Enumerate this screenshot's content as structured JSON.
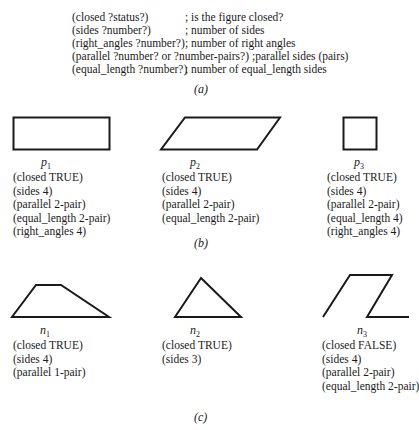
{
  "schema": {
    "lines": [
      {
        "pattern": "(closed ?status?)",
        "comment": "; is the figure closed?"
      },
      {
        "pattern": "(sides ?number?)",
        "comment": "; number of sides"
      },
      {
        "pattern": "(right_angles ?number?)",
        "comment": "; number of right angles"
      },
      {
        "pattern": "(parallel ?number? or ?number-pairs?)",
        "comment": ";parallel sides (pairs)"
      },
      {
        "pattern": "(equal_length ?number?)",
        "comment": "; number of equal_length sides"
      }
    ],
    "caption": "(a)"
  },
  "positive_examples": {
    "caption": "(b)",
    "figures": [
      {
        "label": "p",
        "index": "1",
        "shape": "rectangle",
        "props": [
          "(closed TRUE)",
          "(sides 4)",
          "(parallel 2-pair)",
          "(equal_length 2-pair)",
          "(right_angles 4)"
        ]
      },
      {
        "label": "p",
        "index": "2",
        "shape": "parallelogram",
        "props": [
          "(closed TRUE)",
          "(sides 4)",
          "(parallel 2-pair)",
          "(equal_length 2-pair)"
        ]
      },
      {
        "label": "p",
        "index": "3",
        "shape": "square",
        "props": [
          "(closed TRUE)",
          "(sides 4)",
          "(parallel 2-pair)",
          "(equal_length 4)",
          "(right_angles 4)"
        ]
      }
    ]
  },
  "negative_examples": {
    "caption": "(c)",
    "figures": [
      {
        "label": "n",
        "index": "1",
        "shape": "trapezoid",
        "props": [
          "(closed TRUE)",
          "(sides 4)",
          "(parallel 1-pair)"
        ]
      },
      {
        "label": "n",
        "index": "2",
        "shape": "triangle",
        "props": [
          "(closed TRUE)",
          "(sides 3)"
        ]
      },
      {
        "label": "n",
        "index": "3",
        "shape": "open-parallelogram",
        "props": [
          "(closed FALSE)",
          "(sides 4)",
          "(parallel 2-pair)",
          "(equal_length 2-pair)"
        ]
      }
    ]
  },
  "colors": {
    "stroke": "#1a1a1a",
    "background": "#ffffff"
  }
}
